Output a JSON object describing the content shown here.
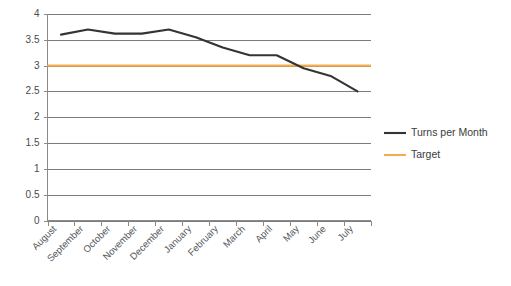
{
  "chart_data": {
    "type": "line",
    "title": "",
    "xlabel": "",
    "ylabel": "",
    "ylim": [
      0,
      4
    ],
    "y_ticks": [
      "0",
      "0.5",
      "1",
      "1.5",
      "2",
      "2.5",
      "3",
      "3.5",
      "4"
    ],
    "grid": true,
    "legend_position": "right",
    "categories": [
      "August",
      "September",
      "October",
      "November",
      "December",
      "January",
      "February",
      "March",
      "April",
      "May",
      "June",
      "July"
    ],
    "series": [
      {
        "name": "Turns per Month",
        "color": "#343434",
        "values": [
          3.6,
          3.7,
          3.62,
          3.62,
          3.7,
          3.55,
          3.35,
          3.2,
          3.2,
          2.95,
          2.8,
          2.5
        ]
      },
      {
        "name": "Target",
        "color": "#f2ad4c",
        "values": [
          3,
          3,
          3,
          3,
          3,
          3,
          3,
          3,
          3,
          3,
          3,
          3
        ]
      }
    ]
  },
  "legend": {
    "items": [
      {
        "label": "Turns per Month",
        "color": "#343434"
      },
      {
        "label": "Target",
        "color": "#f2ad4c"
      }
    ]
  },
  "colors": {
    "series_main": "#343434",
    "series_target": "#f2ad4c",
    "grid": "#7c7c7c",
    "axis": "#8a8a8a",
    "background": "#ffffff"
  }
}
